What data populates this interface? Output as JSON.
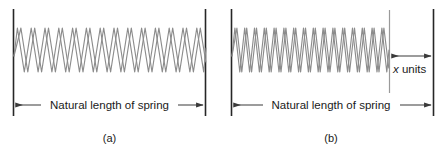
{
  "figure": {
    "panels": [
      {
        "id": "panel-a",
        "caption": "(a)",
        "dimension_label": "Natural length of spring",
        "spring_state": "natural",
        "coil_count": 14,
        "extra_label": null
      },
      {
        "id": "panel-b",
        "caption": "(b)",
        "dimension_label": "Natural length of spring",
        "spring_state": "compressed",
        "coil_count": 16,
        "extra_label": {
          "variable": "x",
          "text": " units",
          "full": "x units"
        }
      }
    ]
  },
  "colors": {
    "spring_stroke": "#8c8c8c",
    "guide_line": "#9a9a9a",
    "wall_line": "#262626",
    "dimension_line": "#3a3a3a",
    "text": "#1a1a1a",
    "background": "#ffffff"
  },
  "geometry": {
    "panel_a": {
      "left_wall_x": 13,
      "right_wall_x": 206,
      "wall_top_y": 9,
      "wall_bottom_y": 116,
      "spring_mid_y": 50,
      "spring_amplitude": 22,
      "dim_y": 105
    },
    "panel_b": {
      "left_wall_x": 231,
      "right_wall_x": 434,
      "spring_end_x": 389,
      "wall_top_y": 9,
      "wall_bottom_y": 116,
      "spring_mid_y": 50,
      "spring_amplitude": 22,
      "dim_y": 105,
      "x_dim_y": 56,
      "x_label_y": 70
    }
  }
}
